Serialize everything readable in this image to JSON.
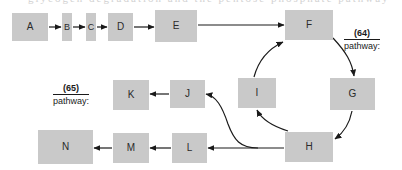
{
  "figure": {
    "title_fragment": "glycogen  degradation  and  the  pentose  phosphate  pathway",
    "background_color": "#ffffff",
    "node_fill_color": "#c9c9c9",
    "stroke_color": "#1a1a1a",
    "width": 402,
    "height": 170
  },
  "nodes": [
    {
      "id": "A",
      "label": "A",
      "x": 12,
      "y": 13,
      "w": 36,
      "h": 28
    },
    {
      "id": "B",
      "label": "B",
      "x": 62,
      "y": 13,
      "w": 10,
      "h": 28
    },
    {
      "id": "C",
      "label": "C",
      "x": 86,
      "y": 13,
      "w": 10,
      "h": 28
    },
    {
      "id": "D",
      "label": "D",
      "x": 108,
      "y": 13,
      "w": 25,
      "h": 28
    },
    {
      "id": "E",
      "label": "E",
      "x": 155,
      "y": 10,
      "w": 42,
      "h": 32
    },
    {
      "id": "F",
      "label": "F",
      "x": 285,
      "y": 10,
      "w": 48,
      "h": 30
    },
    {
      "id": "G",
      "label": "G",
      "x": 330,
      "y": 78,
      "w": 45,
      "h": 32
    },
    {
      "id": "H",
      "label": "H",
      "x": 285,
      "y": 132,
      "w": 48,
      "h": 30
    },
    {
      "id": "I",
      "label": "I",
      "x": 238,
      "y": 78,
      "w": 38,
      "h": 30
    },
    {
      "id": "J",
      "label": "J",
      "x": 170,
      "y": 80,
      "w": 35,
      "h": 28
    },
    {
      "id": "K",
      "label": "K",
      "x": 113,
      "y": 80,
      "w": 36,
      "h": 30
    },
    {
      "id": "L",
      "label": "L",
      "x": 172,
      "y": 133,
      "w": 35,
      "h": 30
    },
    {
      "id": "M",
      "label": "M",
      "x": 113,
      "y": 133,
      "w": 36,
      "h": 30
    },
    {
      "id": "N",
      "label": "N",
      "x": 38,
      "y": 130,
      "w": 55,
      "h": 34
    }
  ],
  "labels": [
    {
      "id": "pathway-64",
      "number": "(64)",
      "word": "pathway:",
      "x": 344,
      "y": 28
    },
    {
      "id": "pathway-65",
      "number": "(65)",
      "word": "pathway:",
      "x": 53,
      "y": 83
    }
  ],
  "edges": [
    {
      "from": "A",
      "to": "B",
      "kind": "straight"
    },
    {
      "from": "B",
      "to": "C",
      "kind": "straight"
    },
    {
      "from": "C",
      "to": "D",
      "kind": "straight"
    },
    {
      "from": "D",
      "to": "E",
      "kind": "straight"
    },
    {
      "from": "E",
      "to": "F",
      "kind": "straight"
    },
    {
      "from": "F",
      "to": "G",
      "kind": "curved"
    },
    {
      "from": "G",
      "to": "H",
      "kind": "curved"
    },
    {
      "from": "H",
      "to": "I",
      "kind": "curved"
    },
    {
      "from": "I",
      "to": "F",
      "kind": "curved"
    },
    {
      "from": "H",
      "to": "L",
      "kind": "straight"
    },
    {
      "from": "H",
      "to": "J",
      "kind": "curved"
    },
    {
      "from": "J",
      "to": "K",
      "kind": "straight"
    },
    {
      "from": "L",
      "to": "M",
      "kind": "straight"
    },
    {
      "from": "M",
      "to": "N",
      "kind": "straight"
    }
  ]
}
